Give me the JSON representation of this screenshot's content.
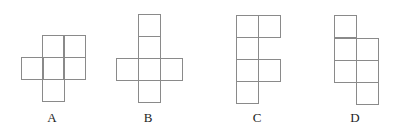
{
  "colors": {
    "line": "#8a8a8a",
    "label": "#1e1e1e",
    "background": "#ffffff"
  },
  "cell_size": 22,
  "figures": [
    {
      "label": "A",
      "label_pos": [
        52,
        122
      ],
      "cells": [
        [
          42,
          35
        ],
        [
          63,
          35
        ],
        [
          21,
          57
        ],
        [
          42,
          57
        ],
        [
          63,
          57
        ],
        [
          42,
          79
        ]
      ]
    },
    {
      "label": "B",
      "label_pos": [
        148,
        122
      ],
      "cells": [
        [
          138,
          14
        ],
        [
          138,
          36
        ],
        [
          116,
          58
        ],
        [
          138,
          58
        ],
        [
          160,
          58
        ],
        [
          138,
          80
        ]
      ]
    },
    {
      "label": "C",
      "label_pos": [
        257,
        122
      ],
      "cells": [
        [
          236,
          15
        ],
        [
          258,
          15
        ],
        [
          236,
          37
        ],
        [
          236,
          59
        ],
        [
          258,
          59
        ],
        [
          236,
          81
        ]
      ]
    },
    {
      "label": "D",
      "label_pos": [
        355,
        122
      ],
      "cells": [
        [
          334,
          15
        ],
        [
          334,
          38
        ],
        [
          356,
          38
        ],
        [
          334,
          60
        ],
        [
          356,
          60
        ],
        [
          356,
          82
        ]
      ]
    }
  ]
}
